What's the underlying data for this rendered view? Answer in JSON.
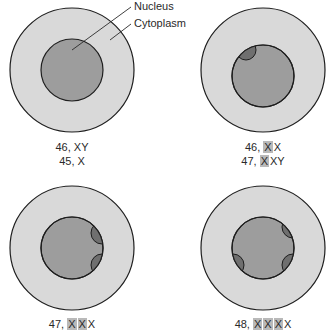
{
  "colors": {
    "cytoplasm": "#d9d9d9",
    "nucleus": "#9d9d9d",
    "barr_body": "#6f6f6f",
    "outline": "#1e1e1e",
    "highlight": "#b9b9b9"
  },
  "callouts": {
    "nucleus": "Nucleus",
    "cytoplasm": "Cytoplasm"
  },
  "cells": [
    {
      "barr_bodies": 0,
      "karyotypes": [
        {
          "prefix": "46, ",
          "highlighted": [],
          "suffix": "XY"
        },
        {
          "prefix": "45, ",
          "highlighted": [],
          "suffix": "X"
        }
      ]
    },
    {
      "barr_bodies": 1,
      "karyotypes": [
        {
          "prefix": "46, ",
          "highlighted": [
            "X"
          ],
          "suffix": "X"
        },
        {
          "prefix": "47, ",
          "highlighted": [
            "X"
          ],
          "suffix": "XY"
        }
      ]
    },
    {
      "barr_bodies": 2,
      "karyotypes": [
        {
          "prefix": "47, ",
          "highlighted": [
            "X",
            "X"
          ],
          "suffix": "X"
        }
      ]
    },
    {
      "barr_bodies": 3,
      "karyotypes": [
        {
          "prefix": "48, ",
          "highlighted": [
            "X",
            "X",
            "X"
          ],
          "suffix": "X"
        }
      ]
    }
  ]
}
